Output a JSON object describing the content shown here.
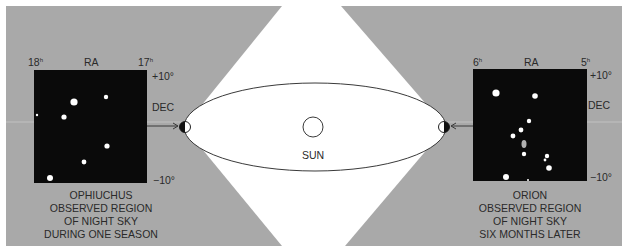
{
  "colors": {
    "panel_gray": "#a9a9a9",
    "sky_black": "#0a0a0a",
    "white": "#ffffff",
    "line": "#3a3a3a",
    "text": "#2a2a2a"
  },
  "sun": {
    "label": "SUN"
  },
  "left_panel": {
    "constellation": "OPHIUCHUS",
    "caption_lines": [
      "OBSERVED REGION",
      "OF NIGHT SKY",
      "DURING ONE SEASON"
    ],
    "ra_left": "18",
    "ra_right": "17",
    "ra_unit": "h",
    "ra_label": "RA",
    "dec_top": "+10°",
    "dec_label": "DEC",
    "dec_bottom": "−10°",
    "stars": [
      {
        "x": 74,
        "y": 102,
        "r": 3.6
      },
      {
        "x": 106,
        "y": 97,
        "r": 2.2
      },
      {
        "x": 37,
        "y": 115,
        "r": 1.2
      },
      {
        "x": 64,
        "y": 117,
        "r": 2.6
      },
      {
        "x": 107,
        "y": 146,
        "r": 2.6
      },
      {
        "x": 84,
        "y": 162,
        "r": 2.4
      },
      {
        "x": 50,
        "y": 178,
        "r": 3.0
      }
    ]
  },
  "right_panel": {
    "constellation": "ORION",
    "caption_lines": [
      "OBSERVED REGION",
      "OF NIGHT SKY",
      "SIX MONTHS LATER"
    ],
    "ra_left": "6",
    "ra_right": "5",
    "ra_unit": "h",
    "ra_label": "RA",
    "dec_top": "+10°",
    "dec_label": "DEC",
    "dec_bottom": "−10°",
    "stars": [
      {
        "x": 496,
        "y": 93,
        "r": 3.6
      },
      {
        "x": 535,
        "y": 96,
        "r": 2.8
      },
      {
        "x": 529,
        "y": 121,
        "r": 2.2
      },
      {
        "x": 521,
        "y": 130,
        "r": 2.4
      },
      {
        "x": 513,
        "y": 136,
        "r": 2.4
      },
      {
        "x": 524,
        "y": 154,
        "r": 2.2
      },
      {
        "x": 547,
        "y": 156,
        "r": 2.2
      },
      {
        "x": 545,
        "y": 160,
        "r": 1.4
      },
      {
        "x": 549,
        "y": 168,
        "r": 2.8
      },
      {
        "x": 506,
        "y": 177,
        "r": 3.0
      },
      {
        "x": 528,
        "y": 180,
        "r": 1.0
      }
    ],
    "nebula": {
      "x": 524,
      "y": 144
    }
  }
}
